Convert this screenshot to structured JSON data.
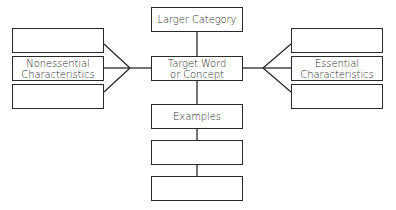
{
  "diagram": {
    "center": {
      "larger_category": "Larger Category",
      "target_line1": "Target Word",
      "target_line2": "or Concept",
      "examples": "Examples",
      "example_boxes": [
        "",
        ""
      ]
    },
    "left": {
      "label_line1": "Nonessential",
      "label_line2": "Characteristics",
      "top_box": "",
      "bottom_box": ""
    },
    "right": {
      "label_line1": "Essential",
      "label_line2": "Characteristics",
      "top_box": "",
      "bottom_box": ""
    },
    "line_color": "#2a2a2a"
  }
}
